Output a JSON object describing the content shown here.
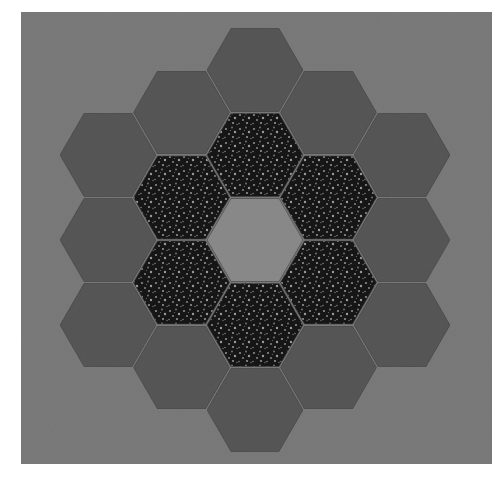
{
  "image": {
    "subject": "Hexagon quilt block (flower garden pattern)",
    "width": 502,
    "height": 479
  },
  "colors": {
    "page": "#ffffff",
    "background_fabric": "#7b7b7b",
    "outer_ring": "#575757",
    "inner_ring": "#161616",
    "inner_ring_speckle": "#8c8c8c",
    "center": "#8b8b8b",
    "seam": "#3c3c3c"
  },
  "geometry": {
    "panel": {
      "x": 21,
      "y": 12,
      "w": 471,
      "h": 452
    },
    "center": {
      "x": 255,
      "y": 240
    },
    "hex_radius": 49,
    "hex_height": 85
  },
  "rings": {
    "center_count": 1,
    "inner_ring_count": 6,
    "outer_ring_count": 12
  }
}
